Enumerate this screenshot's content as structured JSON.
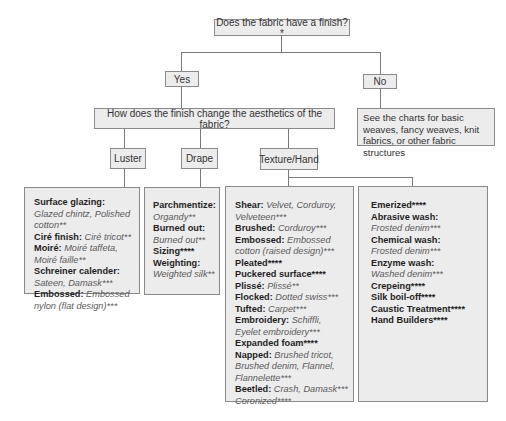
{
  "diagram": {
    "root": {
      "label": "Does the fabric have a finish?*"
    },
    "yes": {
      "label": "Yes"
    },
    "no": {
      "label": "No"
    },
    "no_result": {
      "text": "See the charts for basic weaves, fancy weaves, knit fabrics, or other fabric structures"
    },
    "question2": {
      "label": "How does the finish change the aesthetics of the fabric?"
    },
    "categories": [
      {
        "label": "Luster"
      },
      {
        "label": "Drape"
      },
      {
        "label": "Texture/Hand"
      }
    ],
    "luster_items": [
      {
        "name": "Surface glazing:",
        "examples": "Glazed chintz, Polished cotton**"
      },
      {
        "name": "Ciré finish:",
        "examples": "Ciré tricot**"
      },
      {
        "name": "Moiré:",
        "examples": "Moiré taffeta, Moiré faille**"
      },
      {
        "name": "Schreiner calender:",
        "examples": "Sateen, Damask***"
      },
      {
        "name": "Embossed:",
        "examples": "Embossed nylon (flat design)***"
      }
    ],
    "drape_items": [
      {
        "name": "Parchmentize:",
        "examples": "Organdy**"
      },
      {
        "name": "Burned out:",
        "examples": "Burned out**"
      },
      {
        "name": "Sizing****",
        "examples": ""
      },
      {
        "name": "Weighting:",
        "examples": "Weighted silk**"
      }
    ],
    "texture_items_a": [
      {
        "name": "Shear:",
        "examples": "Velvet, Corduroy, Velveteen***"
      },
      {
        "name": "Brushed:",
        "examples": "Corduroy***"
      },
      {
        "name": "Embossed:",
        "examples": "Embossed cotton (raised design)***"
      },
      {
        "name": "Pleated****",
        "examples": ""
      },
      {
        "name": "Puckered surface****",
        "examples": ""
      },
      {
        "name": "Plissé:",
        "examples": "Plissé**"
      },
      {
        "name": "Flocked:",
        "examples": "Dotted swiss***"
      },
      {
        "name": "Tufted:",
        "examples": "Carpet***"
      },
      {
        "name": "Embroidery:",
        "examples": "Schiffli, Eyelet embroidery***"
      },
      {
        "name": "Expanded foam****",
        "examples": ""
      },
      {
        "name": "Napped:",
        "examples": "Brushed tricot, Brushed denim, Flannel, Flannelette***"
      },
      {
        "name": "Beetled:",
        "examples": "Crash, Damask***"
      },
      {
        "name": "",
        "examples": "Coronized****"
      }
    ],
    "texture_items_b": [
      {
        "name": "Emerized****",
        "examples": ""
      },
      {
        "name": "Abrasive wash:",
        "examples": "Frosted denim***"
      },
      {
        "name": "Chemical wash:",
        "examples": "Frosted denim***"
      },
      {
        "name": "Enzyme wash:",
        "examples": "Washed denim***"
      },
      {
        "name": "Crepeing****",
        "examples": ""
      },
      {
        "name": "Silk boil-off****",
        "examples": ""
      },
      {
        "name": "Caustic Treatment****",
        "examples": ""
      },
      {
        "name": "Hand Builders****",
        "examples": ""
      }
    ],
    "colors": {
      "box_fill": "#ececec",
      "box_border": "#8a8a8a",
      "line": "#7a7a7a"
    }
  }
}
